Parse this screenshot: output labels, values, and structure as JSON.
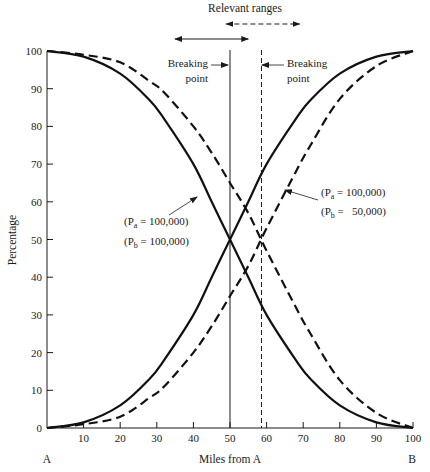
{
  "chart_data": {
    "type": "line",
    "title": "",
    "xlabel": "Miles from A",
    "ylabel": "Percentage",
    "xlim": [
      0,
      100
    ],
    "ylim": [
      0,
      100
    ],
    "x_ticks": [
      10,
      20,
      30,
      40,
      50,
      60,
      70,
      80,
      90,
      100
    ],
    "y_ticks": [
      0,
      10,
      20,
      30,
      40,
      50,
      60,
      70,
      80,
      90,
      100
    ],
    "x_tick_labels": [
      "10",
      "20",
      "30",
      "40",
      "50",
      "60",
      "70",
      "80",
      "90",
      "100"
    ],
    "y_tick_labels": [
      "0",
      "10",
      "20",
      "30",
      "40",
      "50",
      "60",
      "70",
      "80",
      "90",
      "100"
    ],
    "grid": false,
    "endpoint_labels": {
      "left": "A",
      "right": "B"
    },
    "x": [
      0,
      10,
      20,
      28,
      32,
      40,
      45,
      50,
      55,
      60,
      68,
      72,
      80,
      90,
      100
    ],
    "series": [
      {
        "name": "Share to A (Pa = 100,000, Pb = 100,000)",
        "style": "solid",
        "values": [
          100,
          98.5,
          94,
          87,
          82,
          70,
          60,
          50,
          40,
          30,
          18,
          13,
          6,
          1.5,
          0
        ]
      },
      {
        "name": "Share to B (Pa = 100,000, Pb = 100,000)",
        "style": "solid",
        "values": [
          0,
          1.5,
          6,
          13,
          18,
          30,
          40,
          50,
          60,
          70,
          82,
          87,
          94,
          98.5,
          100
        ]
      },
      {
        "name": "Share to A (Pa = 100,000, Pb = 50,000)",
        "style": "dashed",
        "values": [
          100,
          99,
          97,
          92,
          89,
          80,
          73,
          65,
          57,
          47,
          32,
          25,
          12.7,
          4,
          0
        ]
      },
      {
        "name": "Share to B (Pa = 100,000, Pb = 50,000)",
        "style": "dashed",
        "values": [
          0,
          1,
          3,
          8,
          11,
          20,
          27,
          35,
          43,
          53,
          68,
          75,
          87.3,
          96,
          100
        ]
      }
    ],
    "reference_lines": [
      {
        "name": "Breaking point (equal populations)",
        "x": 50,
        "style": "solid"
      },
      {
        "name": "Breaking point (Pb = 50,000)",
        "x": 58.6,
        "style": "dashed"
      }
    ],
    "range_arrows": {
      "title": "Relevant ranges",
      "solid": [
        35,
        55
      ],
      "dashed": [
        49,
        69
      ]
    },
    "annotations": {
      "breaking_point_left": [
        "Breaking",
        "point"
      ],
      "breaking_point_right": [
        "Breaking",
        "point"
      ],
      "equal_pop": {
        "line1_prefix": "(P",
        "line1_sub": "a",
        "line1_suffix": " = 100,000)",
        "line2_prefix": "(P",
        "line2_sub": "b",
        "line2_suffix": " = 100,000)"
      },
      "unequal_pop": {
        "line1_prefix": "(P",
        "line1_sub": "a",
        "line1_suffix": " = 100,000)",
        "line2_prefix": "(P",
        "line2_sub": "b",
        "line2_suffix": " =   50,000)"
      }
    }
  }
}
